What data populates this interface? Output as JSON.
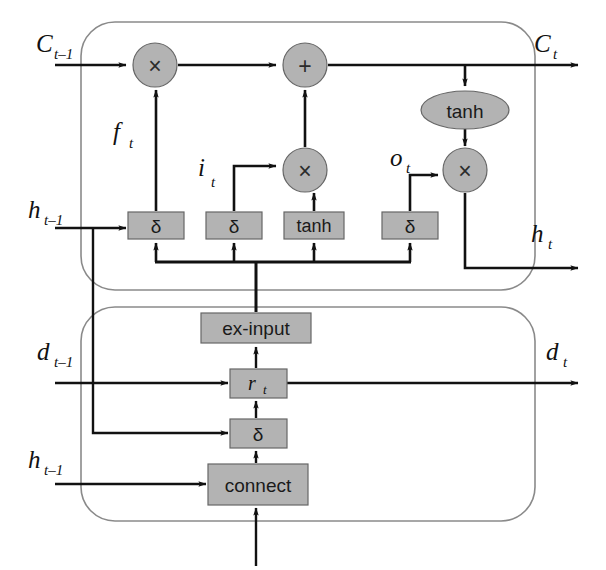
{
  "figure": {
    "colors": {
      "node_fill": "#b3b3b3",
      "node_stroke": "#555555",
      "cell_border": "#8a8a8a",
      "wire": "#111111",
      "background": "#ffffff"
    }
  },
  "top_cell": {
    "name": "memory-cell",
    "inputs": [
      {
        "id": "c_prev",
        "base": "C",
        "sub": "t–1",
        "x": 36,
        "y": 52
      },
      {
        "id": "h_prev",
        "base": "h",
        "sub": "t–1",
        "x": 28,
        "y": 218
      }
    ],
    "outputs": [
      {
        "id": "c_out",
        "base": "C",
        "sub": "t",
        "x": 534,
        "y": 52
      },
      {
        "id": "h_out",
        "base": "h",
        "sub": "t",
        "x": 531,
        "y": 242
      }
    ],
    "operators": [
      {
        "id": "mul-forget",
        "symbol": "×",
        "cx": 155,
        "cy": 65,
        "r": 22
      },
      {
        "id": "add-cell",
        "symbol": "+",
        "cx": 305,
        "cy": 65,
        "r": 22
      },
      {
        "id": "mul-input",
        "symbol": "×",
        "cx": 305,
        "cy": 170,
        "r": 22
      },
      {
        "id": "mul-output",
        "symbol": "×",
        "cx": 465,
        "cy": 170,
        "r": 22
      }
    ],
    "activation_ellipse": {
      "id": "tanh-out",
      "label": "tanh",
      "cx": 465,
      "cy": 110,
      "rx": 44,
      "ry": 19
    },
    "gates": [
      {
        "id": "gate-forget",
        "label": "δ",
        "x": 128,
        "y": 212,
        "w": 56,
        "h": 27
      },
      {
        "id": "gate-input",
        "label": "δ",
        "x": 206,
        "y": 212,
        "w": 56,
        "h": 27
      },
      {
        "id": "gate-candidate",
        "label": "tanh",
        "x": 284,
        "y": 212,
        "w": 60,
        "h": 27
      },
      {
        "id": "gate-output",
        "label": "δ",
        "x": 382,
        "y": 212,
        "w": 56,
        "h": 27
      }
    ],
    "gate_signals": [
      {
        "id": "f_t",
        "base": "f",
        "sub": "t",
        "x": 113,
        "y": 140
      },
      {
        "id": "i_t",
        "base": "i",
        "sub": "t",
        "x": 198,
        "y": 176
      },
      {
        "id": "o_t",
        "base": "o",
        "sub": "t",
        "x": 390,
        "y": 166
      }
    ]
  },
  "bottom_cell": {
    "name": "external-input-cell",
    "inputs": [
      {
        "id": "d_prev",
        "base": "d",
        "sub": "t–1",
        "x": 37,
        "y": 360
      },
      {
        "id": "h_prev_2",
        "base": "h",
        "sub": "t–1",
        "x": 28,
        "y": 468
      }
    ],
    "outputs": [
      {
        "id": "d_out",
        "base": "d",
        "sub": "t",
        "x": 546,
        "y": 360
      }
    ],
    "blocks": [
      {
        "id": "ex-input-block",
        "label": "ex-input",
        "x": 201,
        "y": 313,
        "w": 110,
        "h": 30
      },
      {
        "id": "r-gate-block",
        "label": "r",
        "sub": "t",
        "x": 230,
        "y": 369,
        "w": 57,
        "h": 29
      },
      {
        "id": "sigma-block",
        "label": "δ",
        "x": 230,
        "y": 419,
        "w": 57,
        "h": 29
      },
      {
        "id": "connect-block",
        "label": "connect",
        "x": 208,
        "y": 464,
        "w": 100,
        "h": 41
      }
    ]
  }
}
